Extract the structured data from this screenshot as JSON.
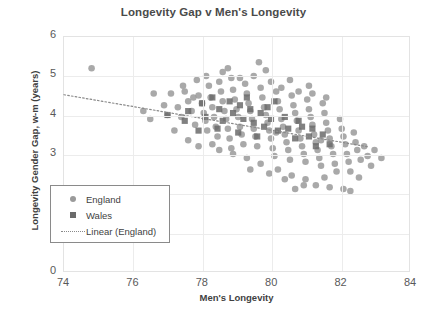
{
  "chart_data": {
    "type": "scatter",
    "title": "Longevity Gap v Men's Longevity",
    "xlabel": "Men's Longevity",
    "ylabel": "Longevity Gender Gap, w-m (years)",
    "xlim": [
      74,
      84
    ],
    "ylim": [
      0,
      6
    ],
    "xticks": [
      74,
      76,
      78,
      80,
      82,
      84
    ],
    "yticks": [
      0,
      1,
      2,
      3,
      4,
      5,
      6
    ],
    "grid": true,
    "legend_position": "lower-left-inside",
    "colors": {
      "england": "#9a9a9a",
      "wales": "#6b6b6b",
      "trendline": "#8a8a8a",
      "title": "#4a4a4a",
      "axis_text": "#595959",
      "gridline": "#ececec",
      "frame": "#e3e3e3"
    },
    "legend": [
      {
        "label": "England",
        "marker": "circle",
        "color": "#9a9a9a"
      },
      {
        "label": "Wales",
        "marker": "square",
        "color": "#6b6b6b"
      },
      {
        "label": "Linear (England)",
        "marker": "dotted-line",
        "color": "#8a8a8a"
      }
    ],
    "series": [
      {
        "name": "England",
        "marker": "circle",
        "color": "#9a9a9a",
        "points": [
          [
            74.8,
            5.2
          ],
          [
            76.6,
            4.55
          ],
          [
            76.9,
            4.25
          ],
          [
            77.0,
            4.0
          ],
          [
            77.1,
            4.55
          ],
          [
            77.3,
            4.2
          ],
          [
            77.4,
            3.95
          ],
          [
            77.5,
            4.6
          ],
          [
            77.6,
            4.35
          ],
          [
            77.7,
            4.1
          ],
          [
            77.8,
            3.75
          ],
          [
            77.9,
            4.5
          ],
          [
            78.0,
            4.3
          ],
          [
            78.05,
            4.05
          ],
          [
            78.1,
            3.85
          ],
          [
            78.15,
            3.6
          ],
          [
            78.2,
            4.75
          ],
          [
            78.25,
            4.45
          ],
          [
            78.3,
            4.2
          ],
          [
            78.35,
            3.95
          ],
          [
            78.4,
            3.7
          ],
          [
            78.45,
            3.45
          ],
          [
            78.5,
            4.85
          ],
          [
            78.55,
            4.6
          ],
          [
            78.6,
            4.35
          ],
          [
            78.65,
            4.1
          ],
          [
            78.7,
            3.9
          ],
          [
            78.75,
            3.65
          ],
          [
            78.8,
            3.4
          ],
          [
            78.85,
            4.95
          ],
          [
            78.9,
            4.65
          ],
          [
            78.95,
            4.4
          ],
          [
            79.0,
            4.15
          ],
          [
            79.05,
            3.95
          ],
          [
            79.1,
            3.7
          ],
          [
            79.15,
            3.5
          ],
          [
            79.2,
            3.25
          ],
          [
            79.25,
            4.8
          ],
          [
            79.3,
            4.55
          ],
          [
            79.35,
            4.3
          ],
          [
            79.4,
            4.1
          ],
          [
            79.45,
            3.9
          ],
          [
            79.5,
            3.65
          ],
          [
            79.55,
            3.45
          ],
          [
            79.6,
            3.2
          ],
          [
            79.65,
            5.35
          ],
          [
            79.7,
            4.7
          ],
          [
            79.75,
            4.45
          ],
          [
            79.8,
            4.2
          ],
          [
            79.85,
            4.0
          ],
          [
            79.9,
            3.8
          ],
          [
            79.95,
            3.6
          ],
          [
            80.0,
            3.4
          ],
          [
            80.05,
            3.15
          ],
          [
            80.1,
            2.95
          ],
          [
            80.15,
            4.6
          ],
          [
            80.2,
            4.35
          ],
          [
            80.25,
            4.15
          ],
          [
            80.3,
            3.9
          ],
          [
            80.35,
            3.7
          ],
          [
            80.4,
            3.5
          ],
          [
            80.45,
            3.3
          ],
          [
            80.5,
            3.1
          ],
          [
            80.55,
            2.85
          ],
          [
            80.6,
            4.5
          ],
          [
            80.65,
            4.25
          ],
          [
            80.7,
            4.05
          ],
          [
            80.75,
            3.85
          ],
          [
            80.8,
            3.6
          ],
          [
            80.85,
            3.4
          ],
          [
            80.9,
            3.2
          ],
          [
            80.95,
            3.0
          ],
          [
            81.0,
            2.8
          ],
          [
            81.05,
            4.4
          ],
          [
            81.1,
            4.15
          ],
          [
            81.15,
            3.95
          ],
          [
            81.2,
            3.75
          ],
          [
            81.25,
            3.5
          ],
          [
            81.3,
            3.3
          ],
          [
            81.35,
            3.1
          ],
          [
            81.4,
            2.9
          ],
          [
            81.45,
            2.7
          ],
          [
            81.5,
            4.3
          ],
          [
            81.55,
            4.05
          ],
          [
            81.6,
            3.8
          ],
          [
            81.65,
            3.6
          ],
          [
            81.7,
            3.4
          ],
          [
            81.75,
            3.2
          ],
          [
            81.8,
            3.0
          ],
          [
            81.85,
            2.75
          ],
          [
            81.9,
            2.55
          ],
          [
            82.0,
            3.9
          ],
          [
            82.05,
            3.65
          ],
          [
            82.1,
            3.45
          ],
          [
            82.15,
            3.25
          ],
          [
            82.2,
            3.0
          ],
          [
            82.25,
            2.8
          ],
          [
            82.3,
            2.55
          ],
          [
            82.4,
            3.55
          ],
          [
            82.45,
            3.3
          ],
          [
            82.5,
            3.1
          ],
          [
            82.6,
            2.85
          ],
          [
            82.7,
            3.2
          ],
          [
            82.8,
            2.95
          ],
          [
            83.0,
            3.1
          ],
          [
            83.2,
            2.9
          ],
          [
            76.3,
            4.1
          ],
          [
            76.5,
            3.9
          ],
          [
            77.2,
            3.6
          ],
          [
            77.45,
            4.75
          ],
          [
            77.85,
            4.9
          ],
          [
            78.12,
            5.0
          ],
          [
            78.6,
            5.1
          ],
          [
            79.1,
            4.95
          ],
          [
            79.5,
            5.0
          ],
          [
            80.0,
            4.85
          ],
          [
            80.3,
            4.7
          ],
          [
            80.8,
            4.6
          ],
          [
            81.2,
            4.55
          ],
          [
            81.6,
            4.45
          ],
          [
            81.1,
            4.75
          ],
          [
            79.3,
            2.9
          ],
          [
            79.7,
            2.75
          ],
          [
            80.2,
            2.6
          ],
          [
            80.6,
            2.45
          ],
          [
            81.0,
            2.35
          ],
          [
            81.3,
            2.2
          ],
          [
            81.7,
            2.15
          ],
          [
            82.1,
            2.1
          ],
          [
            82.3,
            2.05
          ],
          [
            81.55,
            2.4
          ],
          [
            80.95,
            2.2
          ],
          [
            80.4,
            2.35
          ],
          [
            79.95,
            2.5
          ],
          [
            78.5,
            3.1
          ],
          [
            78.9,
            3.0
          ],
          [
            77.6,
            3.35
          ],
          [
            77.9,
            3.2
          ],
          [
            78.3,
            3.25
          ],
          [
            79.4,
            2.6
          ],
          [
            80.7,
            2.1
          ],
          [
            82.55,
            2.4
          ],
          [
            82.9,
            2.7
          ],
          [
            80.55,
            4.9
          ],
          [
            79.85,
            5.15
          ],
          [
            78.75,
            5.2
          ],
          [
            77.75,
            4.45
          ],
          [
            78.85,
            3.15
          ],
          [
            80.15,
            3.55
          ],
          [
            81.45,
            3.35
          ]
        ]
      },
      {
        "name": "Wales",
        "marker": "square",
        "color": "#6b6b6b",
        "points": [
          [
            77.0,
            4.0
          ],
          [
            77.5,
            3.85
          ],
          [
            77.6,
            4.1
          ],
          [
            78.0,
            4.3
          ],
          [
            78.1,
            3.95
          ],
          [
            78.3,
            4.45
          ],
          [
            78.5,
            4.15
          ],
          [
            78.6,
            3.85
          ],
          [
            78.8,
            4.35
          ],
          [
            78.9,
            4.05
          ],
          [
            79.1,
            4.25
          ],
          [
            79.2,
            3.9
          ],
          [
            79.3,
            4.45
          ],
          [
            79.4,
            4.15
          ],
          [
            79.5,
            3.8
          ],
          [
            79.7,
            4.05
          ],
          [
            79.8,
            3.7
          ],
          [
            79.9,
            4.2
          ],
          [
            80.0,
            3.9
          ],
          [
            80.2,
            3.6
          ],
          [
            80.4,
            3.95
          ],
          [
            80.5,
            3.65
          ],
          [
            80.7,
            3.4
          ],
          [
            80.9,
            3.7
          ],
          [
            81.1,
            3.45
          ],
          [
            81.3,
            3.2
          ],
          [
            81.5,
            3.5
          ],
          [
            81.7,
            3.25
          ],
          [
            79.05,
            3.55
          ],
          [
            78.45,
            3.65
          ],
          [
            80.1,
            4.35
          ],
          [
            80.8,
            3.85
          ],
          [
            81.2,
            3.65
          ],
          [
            77.9,
            3.6
          ],
          [
            79.6,
            3.45
          ]
        ]
      }
    ],
    "trendline": {
      "name": "Linear (England)",
      "style": "dotted",
      "color": "#8a8a8a",
      "x_start": 74.0,
      "y_start": 4.52,
      "x_end": 82.85,
      "y_end": 3.18
    }
  }
}
